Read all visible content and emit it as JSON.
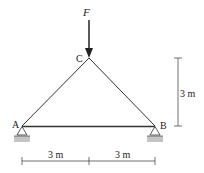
{
  "diagram": {
    "type": "truss",
    "colors": {
      "member": "#333333",
      "ground": "#bdbdbd"
    },
    "load": {
      "label": "F",
      "at": "C",
      "direction": "down"
    },
    "joints": [
      {
        "id": "A",
        "label": "A",
        "support": "pin"
      },
      {
        "id": "B",
        "label": "B",
        "support": "pin"
      },
      {
        "id": "C",
        "label": "C"
      }
    ],
    "members": [
      {
        "from": "A",
        "to": "C"
      },
      {
        "from": "C",
        "to": "B"
      },
      {
        "from": "A",
        "to": "B"
      }
    ],
    "dimensions": {
      "height": "3 m",
      "span_left": "3 m",
      "span_right": "3 m"
    }
  }
}
